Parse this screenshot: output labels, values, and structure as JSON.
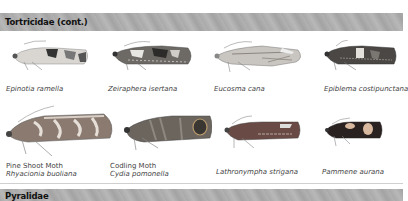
{
  "sections": [
    {
      "title": "Tortricidae (cont.)"
    },
    {
      "title": "Pyralidae"
    }
  ],
  "species": [
    {
      "scientific": "Epinotia ramella",
      "common": ""
    },
    {
      "scientific": "Zeiraphera isertana",
      "common": ""
    },
    {
      "scientific": "Eucosma cana",
      "common": ""
    },
    {
      "scientific": "Epiblema costipunctana",
      "common": ""
    },
    {
      "scientific": "Rhyacionia buoliana",
      "common": "Pine Shoot Moth"
    },
    {
      "scientific": "Cydia pomonella",
      "common": "Codling Moth"
    },
    {
      "scientific": "Lathronympha strigana",
      "common": ""
    },
    {
      "scientific": "Pammene aurana",
      "common": ""
    }
  ],
  "colors": {
    "section_bar": "#ababab",
    "caption_text": "#444444"
  }
}
